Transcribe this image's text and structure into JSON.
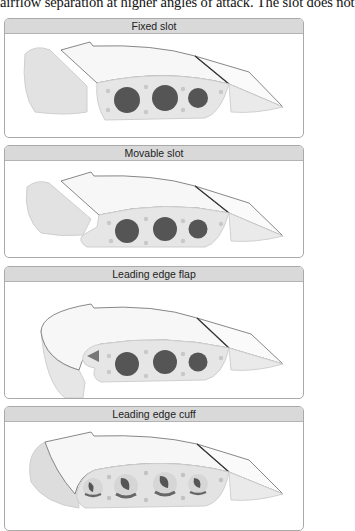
{
  "intro_text": "airflow separation at higher angles of attack. The slot does not",
  "panels": [
    {
      "title": "Fixed slot",
      "variant": "fixed-slot"
    },
    {
      "title": "Movable slot",
      "variant": "movable-slot"
    },
    {
      "title": "Leading edge flap",
      "variant": "leading-edge-flap"
    },
    {
      "title": "Leading edge cuff",
      "variant": "leading-edge-cuff"
    }
  ],
  "colors": {
    "header_bg": "#d9d9d9",
    "panel_border": "#a9a9a9",
    "wing_surface": "#f4f4f4",
    "wing_rib": "#e3e3e3",
    "lightening_hole": "#555555",
    "rivet_dot": "#c8c8c8"
  }
}
